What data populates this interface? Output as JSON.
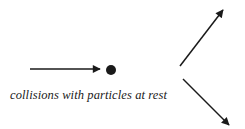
{
  "diagram": {
    "caption": "collisions with particles at rest",
    "colors": {
      "stroke": "#1a1a1a",
      "background": "#ffffff"
    },
    "elements": {
      "incoming_arrow": {
        "x1": 30,
        "y1": 69,
        "x2": 100,
        "y2": 69
      },
      "particle": {
        "cx": 111,
        "cy": 70,
        "r": 5
      },
      "outgoing_arrow_up": {
        "x1": 180,
        "y1": 66,
        "x2": 223,
        "y2": 10
      },
      "outgoing_arrow_down": {
        "x1": 183,
        "y1": 79,
        "x2": 229,
        "y2": 125
      }
    }
  }
}
